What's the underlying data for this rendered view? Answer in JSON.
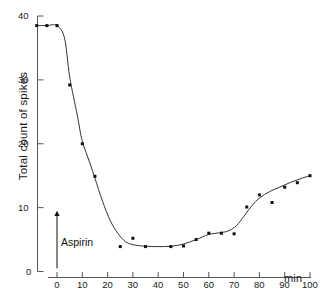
{
  "chart_data": {
    "type": "line",
    "title": "",
    "subtitle": "",
    "xlabel": "min",
    "ylabel": "Total count of spikes",
    "xlim": [
      -8,
      100
    ],
    "ylim": [
      0,
      40
    ],
    "xticks": [
      0,
      10,
      20,
      30,
      40,
      50,
      60,
      70,
      80,
      90,
      100
    ],
    "xticklabels": [
      "0",
      "10",
      "20",
      "30",
      "40",
      "50",
      "60",
      "70",
      "80",
      "90",
      "100"
    ],
    "yticks": [
      0,
      10,
      20,
      30,
      40
    ],
    "yticklabels": [
      "0",
      "10",
      "20",
      "30",
      "40"
    ],
    "grid": false,
    "legend": null,
    "marker": "square-dot",
    "marker_color": "#111111",
    "line_color": "#333333",
    "axis_color": "#555555",
    "series": [
      {
        "name": "Total count of spikes",
        "x": [
          -8,
          -4,
          0,
          5,
          10,
          15,
          25,
          30,
          35,
          45,
          50,
          55,
          60,
          65,
          70,
          75,
          80,
          85,
          90,
          95,
          100
        ],
        "values": [
          38.5,
          38.5,
          38.5,
          29.2,
          20.0,
          14.9,
          3.9,
          5.2,
          3.9,
          3.9,
          4.0,
          5.0,
          6.0,
          6.0,
          5.9,
          10.1,
          12.0,
          10.8,
          13.2,
          13.9,
          15.0
        ]
      }
    ],
    "annotations": [
      {
        "name": "aspirin-marker",
        "label": "Aspirin",
        "x": 0,
        "y_from": 0.5,
        "y_to": 9.5,
        "type": "up-arrow"
      }
    ]
  }
}
